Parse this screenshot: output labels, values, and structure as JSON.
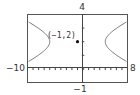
{
  "chart_data": {
    "type": "line",
    "title": "",
    "xlabel": "",
    "ylabel": "",
    "xlim": [
      -10,
      8
    ],
    "ylim": [
      -1,
      4
    ],
    "grid": false,
    "axis_labels": {
      "xmin": "−10",
      "xmax": "8",
      "ymin": "−1",
      "ymax": "4"
    },
    "series": [
      {
        "name": "hyperbola",
        "equation": "(x+1)^2/25 - (y-2)^2 = 1",
        "branches": [
          {
            "name": "left",
            "x": [
              -10,
              -9,
              -8,
              -7,
              -6,
              -7,
              -8,
              -9,
              -10
            ],
            "y": [
              3.5,
              3.33,
              3.14,
              2.92,
              2.0,
              1.08,
              0.86,
              0.67,
              0.5
            ]
          },
          {
            "name": "right",
            "x": [
              8,
              7,
              6,
              5,
              4,
              5,
              6,
              7,
              8
            ],
            "y": [
              3.5,
              3.33,
              3.14,
              2.92,
              2.0,
              1.08,
              0.86,
              0.67,
              0.5
            ]
          }
        ]
      }
    ],
    "points": [
      {
        "x": -1,
        "y": 2,
        "label": "(−1,2)"
      }
    ],
    "ticks": {
      "x_step": 1,
      "y_step": 1
    }
  },
  "labels": {
    "ymax": "4",
    "ymin": "−1",
    "xmin": "−10",
    "xmax": "8",
    "center_point": "(−1,2)"
  }
}
